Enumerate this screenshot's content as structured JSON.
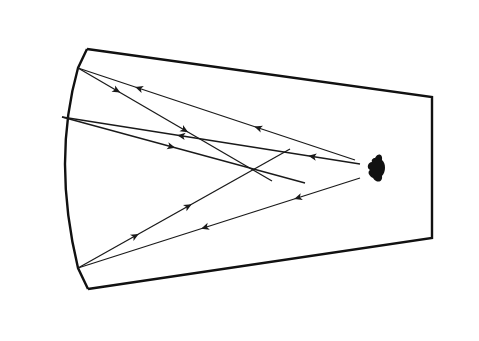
{
  "diagram": {
    "title": "",
    "colors": {
      "ink": "#111111",
      "background": "#ffffff"
    },
    "elements": {
      "enclosure": "tapered trapezoid chamber",
      "mirror": "concave curved mirror (left wall)",
      "source": "point light source (right side, dark blob)",
      "rays": [
        {
          "id": "ray-top-incident",
          "direction": "source-to-mirror",
          "arrow": "toward-mirror"
        },
        {
          "id": "ray-top-reflected",
          "direction": "mirror-to-focus",
          "arrow": "toward-focus"
        },
        {
          "id": "ray-mid-incident",
          "direction": "source-to-mirror",
          "arrow": "toward-mirror"
        },
        {
          "id": "ray-mid-reflected",
          "direction": "mirror-to-focus",
          "arrow": "toward-focus"
        },
        {
          "id": "ray-bottom-incident",
          "direction": "source-to-mirror",
          "arrow": "toward-mirror"
        },
        {
          "id": "ray-bottom-reflected",
          "direction": "mirror-to-focus",
          "arrow": "toward-focus"
        }
      ]
    }
  }
}
